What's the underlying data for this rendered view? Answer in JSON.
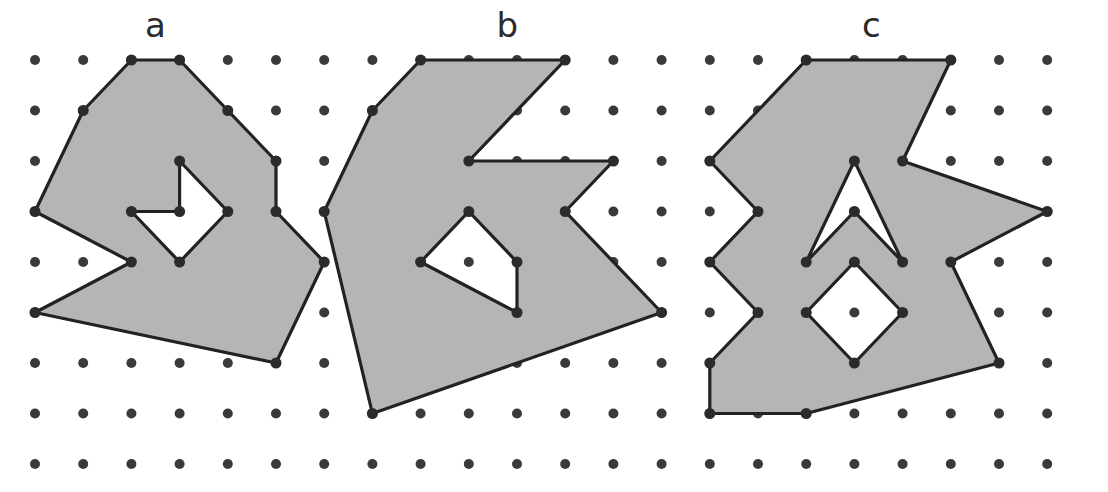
{
  "figure": {
    "title_visible": false,
    "background_color": "#ffffff",
    "lattice": {
      "name": "dot-grid",
      "columns": 22,
      "rows": 9,
      "origin_x": 35,
      "origin_y": 60,
      "spacing_x": 48.2,
      "spacing_y": 50.5,
      "dot_radius": 5,
      "dot_color": "#3a3a3a"
    },
    "style": {
      "polygon_fill": "#b5b5b5",
      "polygon_stroke": "#222222",
      "polygon_stroke_width": 3.2,
      "vertex_dot_color": "#2b2b2b",
      "vertex_dot_radius": 5.5,
      "label_color": "#2b2b2b",
      "label_font_size": 34
    },
    "shapes": [
      {
        "id": "shape-a",
        "label": "a",
        "label_grid_x": 2.5,
        "label_grid_y": -0.45,
        "outer_ring": [
          [
            2,
            0
          ],
          [
            3,
            0
          ],
          [
            4,
            1
          ],
          [
            5,
            2
          ],
          [
            5,
            3
          ],
          [
            6,
            4
          ],
          [
            5,
            6
          ],
          [
            0,
            5
          ],
          [
            2,
            4
          ],
          [
            0,
            3
          ],
          [
            1,
            1
          ]
        ],
        "holes": [
          [
            [
              3,
              2
            ],
            [
              4,
              3
            ],
            [
              3,
              4
            ],
            [
              2,
              3
            ],
            [
              3,
              3
            ]
          ]
        ]
      },
      {
        "id": "shape-b",
        "label": "b",
        "label_grid_x": 9.8,
        "label_grid_y": -0.45,
        "outer_ring": [
          [
            8,
            0
          ],
          [
            11,
            0
          ],
          [
            9,
            2
          ],
          [
            12,
            2
          ],
          [
            11,
            3
          ],
          [
            13,
            5
          ],
          [
            7,
            7
          ],
          [
            6,
            3
          ],
          [
            7,
            1
          ]
        ],
        "holes": [
          [
            [
              9,
              3
            ],
            [
              10,
              4
            ],
            [
              10,
              5
            ],
            [
              8,
              4
            ]
          ]
        ]
      },
      {
        "id": "shape-c",
        "label": "c",
        "label_grid_x": 17.35,
        "label_grid_y": -0.45,
        "outer_ring": [
          [
            16,
            0
          ],
          [
            19,
            0
          ],
          [
            18,
            2
          ],
          [
            21,
            3
          ],
          [
            19,
            4
          ],
          [
            20,
            6
          ],
          [
            16,
            7
          ],
          [
            14,
            7
          ],
          [
            14,
            6
          ],
          [
            15,
            5
          ],
          [
            14,
            4
          ],
          [
            15,
            3
          ],
          [
            14,
            2
          ]
        ],
        "holes": [
          [
            [
              17,
              2
            ],
            [
              18,
              4
            ],
            [
              17,
              3
            ],
            [
              16,
              4
            ]
          ],
          [
            [
              17,
              4
            ],
            [
              18,
              5
            ],
            [
              17,
              6
            ],
            [
              16,
              5
            ]
          ]
        ]
      }
    ],
    "vertex_points": {
      "description": "lattice dots coincident with polygon vertices are drawn darker/larger"
    }
  }
}
